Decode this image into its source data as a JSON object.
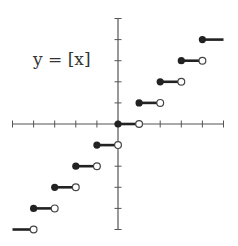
{
  "chart_data": {
    "type": "line",
    "title": "y = [x]",
    "function": "floor",
    "xlim": [
      -5,
      5
    ],
    "ylim": [
      -5,
      5
    ],
    "x_ticks": [
      -5,
      -4,
      -3,
      -2,
      -1,
      0,
      1,
      2,
      3,
      4,
      5
    ],
    "y_ticks": [
      -5,
      -4,
      -3,
      -2,
      -1,
      0,
      1,
      2,
      3,
      4,
      5
    ],
    "tick_labels_shown": false,
    "grid": false,
    "segments": [
      {
        "x_start": -5,
        "x_end": -4,
        "y": -5,
        "start_closed": false,
        "end_open": true
      },
      {
        "x_start": -4,
        "x_end": -3,
        "y": -4,
        "start_closed": true,
        "end_open": true
      },
      {
        "x_start": -3,
        "x_end": -2,
        "y": -3,
        "start_closed": true,
        "end_open": true
      },
      {
        "x_start": -2,
        "x_end": -1,
        "y": -2,
        "start_closed": true,
        "end_open": true
      },
      {
        "x_start": -1,
        "x_end": 0,
        "y": -1,
        "start_closed": true,
        "end_open": true
      },
      {
        "x_start": 0,
        "x_end": 1,
        "y": 0,
        "start_closed": true,
        "end_open": true
      },
      {
        "x_start": 1,
        "x_end": 2,
        "y": 1,
        "start_closed": true,
        "end_open": true
      },
      {
        "x_start": 2,
        "x_end": 3,
        "y": 2,
        "start_closed": true,
        "end_open": true
      },
      {
        "x_start": 3,
        "x_end": 4,
        "y": 3,
        "start_closed": true,
        "end_open": true
      },
      {
        "x_start": 4,
        "x_end": 5,
        "y": 4,
        "start_closed": true,
        "end_open": false
      }
    ],
    "colors": {
      "axis": "#555555",
      "line": "#222222"
    }
  }
}
